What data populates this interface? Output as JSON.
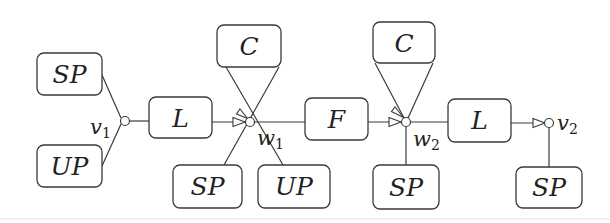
{
  "diagram": {
    "stroke_color": "#3a3a3a",
    "background": "#ffffff",
    "boxes": [
      {
        "id": "sp-v1",
        "label": "SP",
        "x": 37,
        "y": 53,
        "w": 65,
        "h": 42
      },
      {
        "id": "up-v1",
        "label": "UP",
        "x": 37,
        "y": 145,
        "w": 65,
        "h": 42
      },
      {
        "id": "l-1",
        "label": "L",
        "x": 149,
        "y": 97,
        "w": 63,
        "h": 41
      },
      {
        "id": "c-w1",
        "label": "C",
        "x": 217,
        "y": 25,
        "w": 64,
        "h": 42
      },
      {
        "id": "sp-w1",
        "label": "SP",
        "x": 173,
        "y": 165,
        "w": 69,
        "h": 43
      },
      {
        "id": "up-w1",
        "label": "UP",
        "x": 258,
        "y": 165,
        "w": 72,
        "h": 43
      },
      {
        "id": "f",
        "label": "F",
        "x": 305,
        "y": 98,
        "w": 63,
        "h": 42
      },
      {
        "id": "c-w2",
        "label": "C",
        "x": 373,
        "y": 22,
        "w": 62,
        "h": 41
      },
      {
        "id": "sp-w2",
        "label": "SP",
        "x": 373,
        "y": 165,
        "w": 66,
        "h": 44
      },
      {
        "id": "l-2",
        "label": "L",
        "x": 448,
        "y": 99,
        "w": 63,
        "h": 43
      },
      {
        "id": "sp-v2",
        "label": "SP",
        "x": 516,
        "y": 167,
        "w": 66,
        "h": 41
      }
    ],
    "nodes": [
      {
        "id": "v1",
        "label": "v",
        "subscript": "1",
        "cx": 125,
        "cy": 121
      },
      {
        "id": "w1",
        "label": "w",
        "subscript": "1",
        "cx": 250,
        "cy": 122
      },
      {
        "id": "w2",
        "label": "w",
        "subscript": "2",
        "cx": 406,
        "cy": 122
      },
      {
        "id": "v2",
        "label": "v",
        "subscript": "2",
        "cx": 549,
        "cy": 123
      }
    ],
    "labels": {
      "v1": "v",
      "v1_sub": "1",
      "w1": "w",
      "w1_sub": "1",
      "w2": "w",
      "w2_sub": "2",
      "v2": "v",
      "v2_sub": "2"
    },
    "box_labels": {
      "sp_v1": "SP",
      "up_v1": "UP",
      "l_1": "L",
      "c_w1": "C",
      "sp_w1": "SP",
      "up_w1": "UP",
      "f": "F",
      "c_w2": "C",
      "sp_w2": "SP",
      "l_2": "L",
      "sp_v2": "SP"
    },
    "edges": [
      {
        "from": "sp-v1",
        "to": "v1",
        "arrow": false
      },
      {
        "from": "up-v1",
        "to": "v1",
        "arrow": false
      },
      {
        "from": "v1",
        "to": "l-1",
        "arrow": false
      },
      {
        "from": "l-1",
        "to": "w1",
        "arrow": true
      },
      {
        "from": "c-w1",
        "to": "w1",
        "arrow": true
      },
      {
        "from": "c-w1",
        "to": "w1",
        "arrow": false
      },
      {
        "from": "w1",
        "to": "sp-w1",
        "arrow": false
      },
      {
        "from": "w1",
        "to": "up-w1",
        "arrow": false
      },
      {
        "from": "w1",
        "to": "f",
        "arrow": false
      },
      {
        "from": "f",
        "to": "w2",
        "arrow": true
      },
      {
        "from": "c-w2",
        "to": "w2",
        "arrow": true
      },
      {
        "from": "c-w2",
        "to": "w2",
        "arrow": false
      },
      {
        "from": "w2",
        "to": "sp-w2",
        "arrow": false
      },
      {
        "from": "w2",
        "to": "l-2",
        "arrow": false
      },
      {
        "from": "l-2",
        "to": "v2",
        "arrow": true
      },
      {
        "from": "v2",
        "to": "sp-v2",
        "arrow": false
      }
    ]
  }
}
